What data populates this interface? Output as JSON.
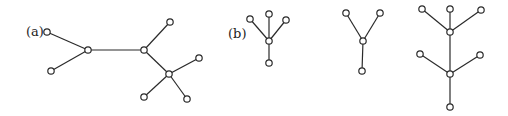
{
  "labels": [
    {
      "id": "a",
      "text": "(a)",
      "x": 26,
      "y": 25
    },
    {
      "id": "b",
      "text": "(b)",
      "x": 228,
      "y": 27
    }
  ],
  "style": {
    "stroke": "#2a2a2a",
    "node_fill": "#ffffff",
    "node_radius": 3.2
  },
  "graphs": [
    {
      "id": "a",
      "nodes": [
        [
          47,
          32
        ],
        [
          51,
          71
        ],
        [
          88,
          50
        ],
        [
          144,
          50
        ],
        [
          170,
          22
        ],
        [
          169,
          74
        ],
        [
          199,
          58
        ],
        [
          144,
          97
        ],
        [
          187,
          99
        ]
      ],
      "edges": [
        [
          0,
          2
        ],
        [
          1,
          2
        ],
        [
          2,
          3
        ],
        [
          3,
          4
        ],
        [
          3,
          5
        ],
        [
          5,
          6
        ],
        [
          5,
          7
        ],
        [
          5,
          8
        ]
      ]
    },
    {
      "id": "b1",
      "nodes": [
        [
          250,
          19
        ],
        [
          269,
          14
        ],
        [
          286,
          20
        ],
        [
          269,
          41
        ],
        [
          269,
          63
        ]
      ],
      "edges": [
        [
          0,
          3
        ],
        [
          1,
          3
        ],
        [
          2,
          3
        ],
        [
          3,
          4
        ]
      ]
    },
    {
      "id": "b2",
      "nodes": [
        [
          346,
          13
        ],
        [
          380,
          13
        ],
        [
          363,
          41
        ],
        [
          362,
          71
        ]
      ],
      "edges": [
        [
          0,
          2
        ],
        [
          1,
          2
        ],
        [
          2,
          3
        ]
      ]
    },
    {
      "id": "b3",
      "nodes": [
        [
          422,
          9
        ],
        [
          450,
          9
        ],
        [
          481,
          10
        ],
        [
          450,
          32
        ],
        [
          420,
          54
        ],
        [
          480,
          55
        ],
        [
          450,
          74
        ],
        [
          450,
          107
        ]
      ],
      "edges": [
        [
          0,
          3
        ],
        [
          1,
          3
        ],
        [
          2,
          3
        ],
        [
          3,
          6
        ],
        [
          4,
          6
        ],
        [
          5,
          6
        ],
        [
          6,
          7
        ]
      ]
    }
  ]
}
